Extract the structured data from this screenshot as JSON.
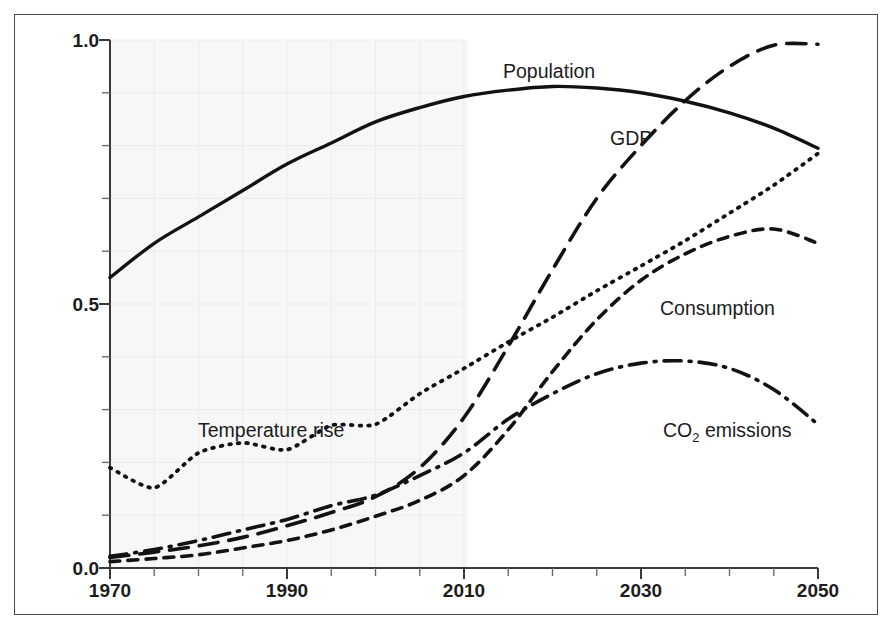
{
  "chart_data": {
    "type": "line",
    "title": "",
    "subtitle": "",
    "xlabel": "",
    "ylabel": "",
    "xlim": [
      1970,
      2050
    ],
    "ylim": [
      0.0,
      1.0
    ],
    "grid": true,
    "grid_region": "1970-2010 (historical shaded panel)",
    "legend_position": "inline-labels",
    "x_ticks_major": [
      1970,
      1990,
      2010,
      2030,
      2050
    ],
    "x_tick_labels": [
      "1970",
      "1990",
      "2010",
      "2030",
      "2050"
    ],
    "x_ticks_minor_step": 5,
    "y_ticks_major": [
      0.0,
      0.5,
      1.0
    ],
    "y_tick_labels": [
      "0.0",
      "0.5",
      "1.0"
    ],
    "y_ticks_minor_step": 0.1,
    "x": [
      1970,
      1975,
      1980,
      1985,
      1990,
      1995,
      2000,
      2005,
      2010,
      2015,
      2020,
      2025,
      2030,
      2035,
      2040,
      2045,
      2050
    ],
    "series": [
      {
        "name": "Population",
        "label": "Population",
        "line_style": "solid",
        "values": [
          0.55,
          0.615,
          0.665,
          0.715,
          0.765,
          0.805,
          0.845,
          0.872,
          0.893,
          0.905,
          0.912,
          0.909,
          0.9,
          0.884,
          0.862,
          0.833,
          0.795
        ]
      },
      {
        "name": "GDP",
        "label": "GDP",
        "line_style": "long-dash",
        "values": [
          0.02,
          0.03,
          0.042,
          0.058,
          0.08,
          0.105,
          0.135,
          0.19,
          0.285,
          0.42,
          0.565,
          0.7,
          0.8,
          0.885,
          0.95,
          0.99,
          0.992
        ]
      },
      {
        "name": "Temperature rise",
        "label": "Temperature rise",
        "line_style": "dotted",
        "values": [
          0.19,
          0.152,
          0.218,
          0.237,
          0.224,
          0.27,
          0.272,
          0.33,
          0.378,
          0.428,
          0.475,
          0.525,
          0.572,
          0.62,
          0.672,
          0.725,
          0.785
        ]
      },
      {
        "name": "Consumption",
        "label": "Consumption",
        "line_style": "short-dash",
        "values": [
          0.012,
          0.018,
          0.025,
          0.038,
          0.052,
          0.072,
          0.098,
          0.128,
          0.175,
          0.262,
          0.372,
          0.47,
          0.545,
          0.595,
          0.628,
          0.642,
          0.615
        ]
      },
      {
        "name": "CO2 emissions",
        "label": "CO₂ emissions",
        "label_base": "CO",
        "label_sub": "2",
        "label_tail": " emissions",
        "line_style": "dash-dot",
        "values": [
          0.022,
          0.035,
          0.052,
          0.072,
          0.092,
          0.118,
          0.138,
          0.175,
          0.218,
          0.282,
          0.33,
          0.368,
          0.388,
          0.392,
          0.378,
          0.338,
          0.272
        ]
      }
    ],
    "annotations": [
      {
        "text": "Population",
        "x": 2012,
        "y": 0.955
      },
      {
        "text": "GDP",
        "x": 2027,
        "y": 0.745
      },
      {
        "text": "Temperature rise",
        "x": 1984,
        "y": 0.315
      },
      {
        "text": "Consumption",
        "x": 2033,
        "y": 0.455
      },
      {
        "text": "CO₂ emissions",
        "x": 2037,
        "y": 0.285
      }
    ],
    "colors": {
      "line": "#121212",
      "axis": "#3a3a3a",
      "grid": "#ececec",
      "shade": "#f7f7f7",
      "frame": "#4a4a4a",
      "text": "#1c1c1c"
    }
  },
  "axes": {
    "y_labels": [
      "1.0",
      "0.5",
      "0.0"
    ],
    "x_labels": [
      "1970",
      "1990",
      "2010",
      "2030",
      "2050"
    ]
  },
  "labels": {
    "population": "Population",
    "gdp": "GDP",
    "temperature_rise": "Temperature rise",
    "consumption": "Consumption",
    "co2_base": "CO",
    "co2_sub": "2",
    "co2_tail": " emissions"
  }
}
